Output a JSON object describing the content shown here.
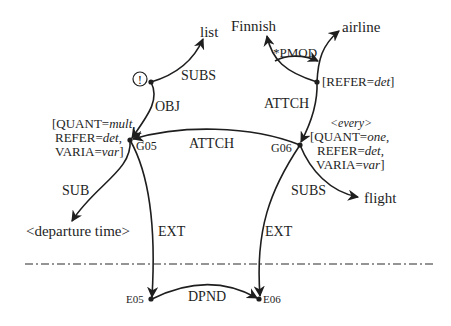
{
  "diagram": {
    "type": "semantic-dependency-graph",
    "nodes": {
      "list": "list",
      "excl": "!",
      "finnish": "Finnish",
      "airline": "airline",
      "flight": "flight",
      "departure_time": "<departure time>",
      "g05": "G05",
      "g06": "G06",
      "e05": "E05",
      "e06": "E06",
      "every": "<every>"
    },
    "g05_features": [
      "[QUANT=",
      "mult",
      ",",
      "REFER=",
      "det",
      ",",
      "VARIA=",
      "var",
      "]"
    ],
    "g05_lines": {
      "l1_a": "[QUANT=",
      "l1_b": "mult",
      "l1_c": ",",
      "l2_a": "REFER=",
      "l2_b": "det",
      "l2_c": ",",
      "l3_a": "VARIA=",
      "l3_b": "var",
      "l3_c": "]"
    },
    "g06_lines": {
      "l1_a": "[QUANT=",
      "l1_b": "one",
      "l1_c": ",",
      "l2_a": "REFER=",
      "l2_b": "det",
      "l2_c": ",",
      "l3_a": "VARIA=",
      "l3_b": "var",
      "l3_c": "]"
    },
    "airline_features": {
      "a": "[REFER=",
      "b": "det",
      "c": "]"
    },
    "edges": {
      "subs_list": "SUBS",
      "obj": "OBJ",
      "attch_g06_g05": "ATTCH",
      "attch_airline_g06": "ATTCH",
      "pmod": "*PMOD",
      "sub_departure": "SUB",
      "subs_flight": "SUBS",
      "ext_g05": "EXT",
      "ext_g06": "EXT",
      "dpnd": "DPND"
    },
    "colors": {
      "ink": "#1e1e1e",
      "background": "#ffffff"
    }
  }
}
